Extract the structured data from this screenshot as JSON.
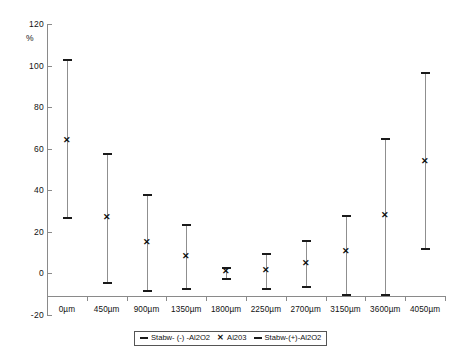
{
  "chart_data": {
    "type": "scatter",
    "title": "",
    "subtitle": "",
    "xlabel": "",
    "ylabel": "%",
    "ylim": [
      -20,
      120
    ],
    "yticks": [
      -20,
      0,
      20,
      40,
      60,
      80,
      100,
      120
    ],
    "grid": false,
    "legend_position": "bottom",
    "baseline_value": -10,
    "categories": [
      "0µm",
      "450µm",
      "900µm",
      "1350µm",
      "1800µm",
      "2250µm",
      "2700µm",
      "3150µm",
      "3600µm",
      "4050µm"
    ],
    "series": [
      {
        "name": "Stabw- (-) -Al2O2",
        "marker": "horizontal-dash",
        "values": [
          27,
          -4,
          -8,
          -7,
          -2,
          -7,
          -6,
          -10,
          -10,
          12
        ]
      },
      {
        "name": "Al203",
        "marker": "x",
        "values": [
          64,
          27,
          15,
          8.5,
          1,
          1.5,
          5,
          11,
          28,
          54
        ]
      },
      {
        "name": "Stabw-(+)-Al2O2",
        "marker": "horizontal-dash",
        "values": [
          103,
          58,
          38,
          24,
          3,
          10,
          16,
          28,
          65,
          97
        ]
      }
    ],
    "legend": [
      {
        "label": "Stabw- (-) -Al2O2",
        "marker": "line"
      },
      {
        "label": "Al203",
        "marker": "x"
      },
      {
        "label": "Stabw-(+)-Al2O2",
        "marker": "line"
      }
    ],
    "colors": {
      "axis": "#8a8a8a",
      "stem": "#8f8f8f",
      "cap": "#1a1a1a",
      "marker": "#111111",
      "background": "#ffffff"
    }
  }
}
